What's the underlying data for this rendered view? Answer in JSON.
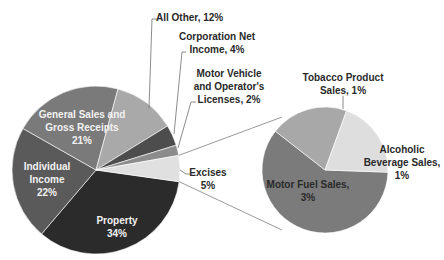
{
  "chart_data": {
    "type": "pie-of-pie",
    "title": "",
    "main_pie": {
      "slices": [
        {
          "label": "Property",
          "value": 34,
          "color": "#2b2b2b",
          "label_text": "Property\n34%"
        },
        {
          "label": "Individual Income",
          "value": 22,
          "color": "#5a5a5a",
          "label_text": "Individual\nIncome\n22%"
        },
        {
          "label": "General Sales and Gross Receipts",
          "value": 21,
          "color": "#7a7a7a",
          "label_text": "General Sales and\nGross Receipts\n21%"
        },
        {
          "label": "All Other",
          "value": 12,
          "color": "#a9a9a9",
          "label_text": "All Other, 12%"
        },
        {
          "label": "Corporation Net Income",
          "value": 4,
          "color": "#4d4d4d",
          "label_text": "Corporation Net\nIncome, 4%"
        },
        {
          "label": "Motor Vehicle and Operator's Licenses",
          "value": 2,
          "color": "#8c8c8c",
          "label_text": "Motor Vehicle\nand Operator's\nLicenses, 2%"
        },
        {
          "label": "Excises",
          "value": 5,
          "color": "#e0e0e0",
          "label_text": "Excises\n5%"
        }
      ]
    },
    "secondary_pie": {
      "breakdown_of": "Excises",
      "slices": [
        {
          "label": "Motor Fuel Sales",
          "value": 3,
          "color": "#7b7b7b",
          "label_text": "Motor Fuel Sales,\n3%"
        },
        {
          "label": "Tobacco Product Sales",
          "value": 1,
          "color": "#a8a8a8",
          "label_text": "Tobacco Product\nSales, 1%"
        },
        {
          "label": "Alcoholic Beverage Sales",
          "value": 1,
          "color": "#dedede",
          "label_text": "Alcoholic\nBeverage Sales,\n1%"
        }
      ]
    },
    "legend": "none (data labels on slices)"
  },
  "labels": {
    "property": "Property\n34%",
    "individual_income": "Individual\nIncome\n22%",
    "general_sales": "General Sales and\nGross Receipts\n21%",
    "all_other": "All Other, 12%",
    "corporation": "Corporation Net\nIncome, 4%",
    "motor_vehicle": "Motor Vehicle\nand Operator's\nLicenses, 2%",
    "excises": "Excises\n5%",
    "motor_fuel": "Motor Fuel Sales,\n3%",
    "tobacco": "Tobacco Product\nSales, 1%",
    "alcoholic": "Alcoholic\nBeverage Sales,\n1%"
  }
}
